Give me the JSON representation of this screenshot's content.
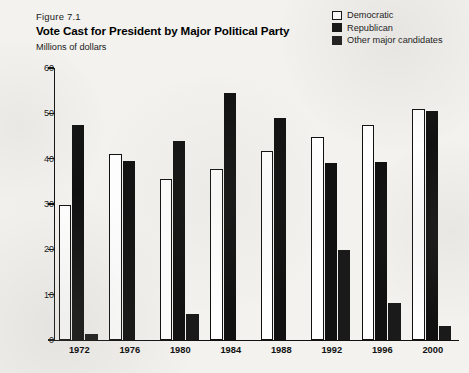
{
  "figure_label": "Figure 7.1",
  "legend": {
    "items": [
      {
        "label": "Democratic",
        "swatch": "white-square-outline",
        "color": "#ffffff"
      },
      {
        "label": "Republican",
        "swatch": "black-square",
        "color": "#111111"
      },
      {
        "label": "Other major candidates",
        "swatch": "dark-square",
        "color": "#1d1d1d"
      }
    ]
  },
  "chart_data": {
    "type": "bar",
    "title": "Vote Cast for President by Major Political Party",
    "subtitle": "Millions of dollars",
    "xlabel": "",
    "ylabel": "Millions of dollars",
    "ylim": [
      0,
      60
    ],
    "yticks": [
      0,
      10,
      20,
      30,
      40,
      50,
      60
    ],
    "grid": false,
    "legend_position": "top-right",
    "categories": [
      "1972",
      "1976",
      "1980",
      "1984",
      "1988",
      "1992",
      "1996",
      "2000"
    ],
    "series": [
      {
        "name": "Democratic",
        "color": "#ffffff",
        "values": [
          29.8,
          41.0,
          35.5,
          37.8,
          41.8,
          44.8,
          47.4,
          51.0
        ]
      },
      {
        "name": "Republican",
        "color": "#111111",
        "values": [
          47.5,
          39.4,
          44.0,
          54.5,
          48.9,
          39.1,
          39.2,
          50.5
        ]
      },
      {
        "name": "Other major candidates",
        "color": "#1a1a1a",
        "values": [
          1.4,
          0,
          5.8,
          0,
          0,
          19.8,
          8.2,
          3.0
        ]
      }
    ]
  }
}
